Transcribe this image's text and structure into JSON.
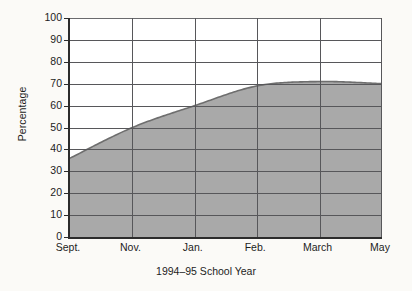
{
  "chart_data": {
    "type": "area",
    "title": "",
    "xlabel": "1994–95 School Year",
    "ylabel": "Percentage",
    "x": [
      "Sept.",
      "Nov.",
      "Jan.",
      "Feb.",
      "March",
      "May"
    ],
    "categories": [
      "Sept.",
      "Nov.",
      "Jan.",
      "Feb.",
      "March",
      "May"
    ],
    "values": [
      36,
      50,
      60,
      69,
      71,
      70
    ],
    "series": [
      {
        "name": "Percentage",
        "values": [
          36,
          50,
          60,
          69,
          71,
          70
        ]
      }
    ],
    "ylim": [
      0,
      100
    ],
    "ytick_labels": [
      "0",
      "10",
      "20",
      "30",
      "40",
      "50",
      "60",
      "70",
      "80",
      "90",
      "100"
    ],
    "ytick_values": [
      0,
      10,
      20,
      30,
      40,
      50,
      60,
      70,
      80,
      90,
      100
    ],
    "xtick_labels": [
      "Sept.",
      "Nov.",
      "Jan.",
      "Feb.",
      "March",
      "May"
    ],
    "grid": true,
    "legend": null,
    "legend_position": "none",
    "colors": {
      "area_fill": "#a9a9a9",
      "area_edge": "#6e6e6e",
      "gridline": "#57575a",
      "axis": "#2c2c2c",
      "plot_background": "#ffffff",
      "figure_background": "#fbfaf7",
      "text": "#1d1d1d"
    }
  }
}
